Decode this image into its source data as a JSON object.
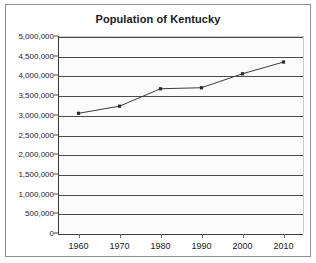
{
  "chart_data": {
    "type": "line",
    "title": "Population of Kentucky",
    "xlabel": "",
    "ylabel": "",
    "x": [
      1960,
      1970,
      1980,
      1990,
      2000,
      2010
    ],
    "categories": [
      "1960",
      "1970",
      "1980",
      "1990",
      "2000",
      "2010"
    ],
    "values": [
      3038000,
      3219000,
      3661000,
      3687000,
      4042000,
      4339000
    ],
    "series": [
      {
        "name": "Population of Kentucky",
        "values": [
          3038000,
          3219000,
          3661000,
          3687000,
          4042000,
          4339000
        ]
      }
    ],
    "xlim": [
      1955,
      2015
    ],
    "ylim": [
      0,
      5000000
    ],
    "ytick_step": 500000,
    "ytick_labels": [
      "5,000,000",
      "4,500,000",
      "4,000,000",
      "3,500,000",
      "3,000,000",
      "2,500,000",
      "2,000,000",
      "1,500,000",
      "1,000,000",
      "500,000",
      "0"
    ],
    "ytick_values": [
      5000000,
      4500000,
      4000000,
      3500000,
      3000000,
      2500000,
      2000000,
      1500000,
      1000000,
      500000,
      0
    ],
    "xtick_labels": [
      "1960",
      "1970",
      "1980",
      "1990",
      "2000",
      "2010"
    ],
    "grid": "horizontal",
    "legend": "none",
    "marker": "square",
    "colors": {
      "line": "#3c3c3c",
      "marker": "#2b2b2b",
      "gridline": "#4a4a4a",
      "plot_background": "#fbfbfb",
      "frame_border": "#8f8f8f",
      "text": "#202020"
    }
  }
}
